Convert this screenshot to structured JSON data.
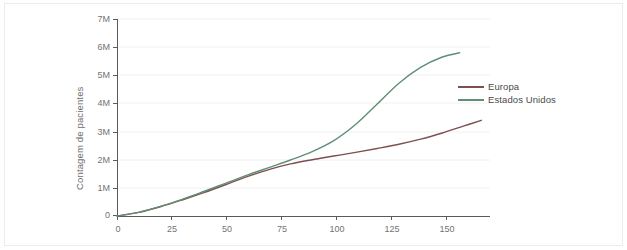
{
  "chart_data": {
    "type": "line",
    "title": "",
    "subtitle": "",
    "xlabel": "",
    "ylabel": "Contagem de pacientes",
    "xlim": [
      0,
      172
    ],
    "ylim": [
      0,
      7000000
    ],
    "grid": true,
    "grid_axis": "y",
    "legend_position": "center-right",
    "y_tick_labels": [
      "7M",
      "6M",
      "5M",
      "4M",
      "3M",
      "2M",
      "1M",
      "0"
    ],
    "y_tick_values": [
      7000000,
      6000000,
      5000000,
      4000000,
      3000000,
      2000000,
      1000000,
      0
    ],
    "x_tick_labels": [
      "0",
      "25",
      "50",
      "75",
      "100",
      "125",
      "150"
    ],
    "x_tick_values": [
      0,
      25,
      50,
      75,
      100,
      125,
      150
    ],
    "series": [
      {
        "name": "Europa",
        "color": "#7d4f4f",
        "x": [
          0,
          10,
          20,
          30,
          40,
          50,
          60,
          70,
          80,
          90,
          100,
          110,
          120,
          130,
          140,
          150,
          160,
          168
        ],
        "values": [
          0,
          130000,
          330000,
          570000,
          830000,
          1110000,
          1400000,
          1650000,
          1850000,
          2000000,
          2130000,
          2260000,
          2400000,
          2550000,
          2730000,
          2950000,
          3200000,
          3400000
        ]
      },
      {
        "name": "Estados Unidos",
        "color": "#5f8f76",
        "x": [
          0,
          10,
          20,
          30,
          40,
          50,
          60,
          70,
          80,
          90,
          100,
          110,
          120,
          130,
          140,
          150,
          158
        ],
        "values": [
          0,
          130000,
          340000,
          590000,
          870000,
          1160000,
          1450000,
          1720000,
          1990000,
          2290000,
          2680000,
          3250000,
          3980000,
          4720000,
          5280000,
          5650000,
          5800000
        ]
      }
    ]
  },
  "legend": {
    "items": [
      {
        "label": "Europa",
        "color": "#7d4f4f"
      },
      {
        "label": "Estados Unidos",
        "color": "#5f8f76"
      }
    ]
  },
  "axes": {
    "y_title": "Contagem de pacientes",
    "y_ticks": [
      "7M",
      "6M",
      "5M",
      "4M",
      "3M",
      "2M",
      "1M",
      "0"
    ],
    "x_ticks": [
      "0",
      "25",
      "50",
      "75",
      "100",
      "125",
      "150"
    ]
  },
  "colors": {
    "background": "#ffffff",
    "card_border": "#ececec",
    "gridline": "#f0f0f0",
    "axis_line": "#5b5b5b",
    "tick_text": "#737373",
    "series_europa": "#7d4f4f",
    "series_estados_unidos": "#5f8f76"
  }
}
